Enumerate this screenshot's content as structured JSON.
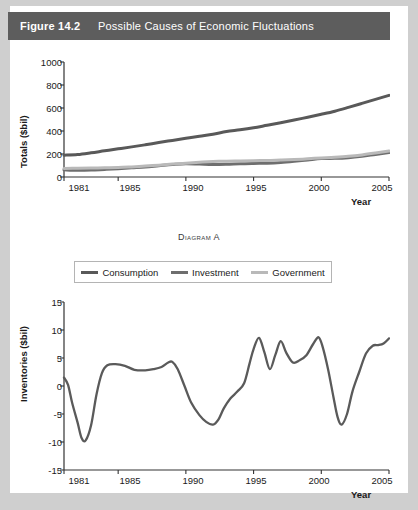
{
  "figure": {
    "number": "Figure 14.2",
    "title": "Possible Causes of Economic Fluctuations"
  },
  "colors": {
    "header_bg": "#5d5d5d",
    "header_text": "#ffffff",
    "consumption": "#595959",
    "investment": "#6e6e6e",
    "government": "#b9b9b9",
    "inventories": "#5a5a5a",
    "axis": "#333333",
    "card_bg": "#ffffff",
    "page_bg": "#cfcfcf"
  },
  "diagram_a": {
    "caption_prefix": "D",
    "caption": "Diagram A",
    "ylabel": "Totals ($bil)",
    "xlabel": "Year",
    "yticks": [
      "1000",
      "800",
      "600",
      "400",
      "200",
      "0"
    ],
    "xticks": [
      "1981",
      "1985",
      "1990",
      "1995",
      "2000",
      "2005"
    ],
    "legend": [
      {
        "label": "Consumption",
        "color": "#595959"
      },
      {
        "label": "Investment",
        "color": "#6e6e6e"
      },
      {
        "label": "Government",
        "color": "#b9b9b9"
      }
    ]
  },
  "diagram_b": {
    "caption": "Diagram B",
    "ylabel": "Inventories ($bil)",
    "xlabel": "Year",
    "yticks": [
      "15",
      "10",
      "5",
      "0",
      "-5",
      "-10",
      "-15"
    ],
    "xticks": [
      "1981",
      "1985",
      "1990",
      "1995",
      "2000",
      "2005"
    ]
  },
  "chart_data": [
    {
      "type": "line",
      "id": "diagram-a",
      "title": "Diagram A",
      "xlabel": "Year",
      "ylabel": "Totals ($bil)",
      "xlim": [
        1981,
        2005
      ],
      "ylim": [
        0,
        1000
      ],
      "yticks": [
        0,
        200,
        400,
        600,
        800,
        1000
      ],
      "xticks": [
        1981,
        1985,
        1990,
        1995,
        2000,
        2005
      ],
      "grid": false,
      "legend_position": "below-plot",
      "x": [
        1981,
        1982,
        1983,
        1984,
        1985,
        1986,
        1987,
        1988,
        1989,
        1990,
        1991,
        1992,
        1993,
        1994,
        1995,
        1996,
        1997,
        1998,
        1999,
        2000,
        2001,
        2002,
        2003,
        2004,
        2005
      ],
      "series": [
        {
          "name": "Consumption",
          "color": "#595959",
          "values": [
            190,
            195,
            210,
            228,
            245,
            262,
            280,
            300,
            318,
            337,
            355,
            372,
            395,
            410,
            428,
            450,
            472,
            495,
            520,
            545,
            572,
            605,
            640,
            675,
            710
          ]
        },
        {
          "name": "Investment",
          "color": "#6e6e6e",
          "values": [
            62,
            58,
            60,
            66,
            72,
            80,
            88,
            98,
            108,
            116,
            112,
            108,
            110,
            115,
            118,
            120,
            126,
            136,
            148,
            160,
            162,
            168,
            180,
            196,
            212
          ]
        },
        {
          "name": "Government",
          "color": "#b9b9b9",
          "values": [
            75,
            76,
            78,
            80,
            82,
            88,
            95,
            103,
            112,
            120,
            128,
            134,
            138,
            140,
            142,
            144,
            148,
            152,
            158,
            166,
            172,
            180,
            192,
            208,
            226
          ]
        }
      ]
    },
    {
      "type": "line",
      "id": "diagram-b",
      "title": "Diagram B",
      "xlabel": "Year",
      "ylabel": "Inventories ($bil)",
      "xlim": [
        1981,
        2005
      ],
      "ylim": [
        -15,
        15
      ],
      "yticks": [
        -15,
        -10,
        -5,
        0,
        5,
        10,
        15
      ],
      "xticks": [
        1981,
        1985,
        1990,
        1995,
        2000,
        2005
      ],
      "grid": false,
      "series": [
        {
          "name": "Inventories",
          "color": "#5a5a5a",
          "x": [
            1981.0,
            1981.3,
            1981.6,
            1982.0,
            1982.3,
            1982.6,
            1983.0,
            1983.4,
            1983.8,
            1984.2,
            1984.8,
            1985.5,
            1986.2,
            1987.0,
            1987.6,
            1988.2,
            1988.7,
            1989.0,
            1989.4,
            1989.9,
            1990.4,
            1991.0,
            1991.5,
            1992.0,
            1992.4,
            1992.8,
            1993.3,
            1993.8,
            1994.3,
            1994.7,
            1995.0,
            1995.4,
            1995.8,
            1996.2,
            1996.6,
            1997.0,
            1997.4,
            1997.9,
            1998.4,
            1998.9,
            1999.4,
            1999.8,
            2000.1,
            2000.5,
            2000.9,
            2001.2,
            2001.5,
            2001.9,
            2002.3,
            2002.8,
            2003.3,
            2003.8,
            2004.2,
            2004.6,
            2005.0
          ],
          "values": [
            1.5,
            0.2,
            -3.0,
            -6.5,
            -9.3,
            -9.7,
            -7.0,
            -1.5,
            2.3,
            3.7,
            3.9,
            3.6,
            2.9,
            2.8,
            3.0,
            3.4,
            4.2,
            4.3,
            3.0,
            0.0,
            -3.0,
            -5.2,
            -6.4,
            -6.9,
            -6.0,
            -4.0,
            -2.2,
            -1.0,
            0.5,
            4.0,
            6.6,
            8.6,
            6.0,
            3.0,
            5.5,
            8.0,
            6.0,
            4.2,
            4.6,
            5.5,
            7.5,
            8.7,
            7.0,
            3.0,
            -2.0,
            -5.5,
            -6.9,
            -5.0,
            -1.0,
            2.5,
            5.8,
            7.2,
            7.3,
            7.6,
            8.5
          ]
        }
      ]
    }
  ]
}
